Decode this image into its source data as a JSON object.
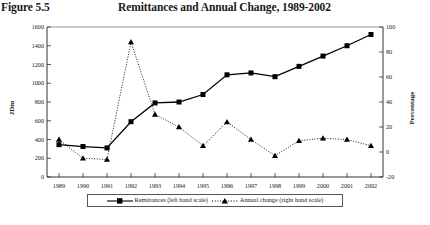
{
  "header": {
    "figure_label": "Figure 5.5",
    "title": "Remittances and Annual Change, 1989-2002"
  },
  "legend": {
    "items": [
      {
        "label": "Remittances (left hand scale)",
        "marker": "square",
        "line": "solid",
        "color": "#000000"
      },
      {
        "label": "Annual change (right hand scale)",
        "marker": "triangle",
        "line": "dotted",
        "color": "#000000"
      }
    ]
  },
  "chart_data": {
    "type": "line",
    "title": "Remittances and Annual Change, 1989-2002",
    "xlabel": "Year",
    "ylabel": "JDm",
    "y2label": "Percentage",
    "categories": [
      "1989",
      "1990",
      "1991",
      "1992",
      "1993",
      "1994",
      "1995",
      "1996",
      "1997",
      "1998",
      "1999",
      "2000",
      "2001",
      "2002"
    ],
    "ylim": [
      0,
      1600
    ],
    "yticks": [
      "0",
      "200",
      "400",
      "600",
      "800",
      "1000",
      "1200",
      "1400",
      "1600"
    ],
    "y2lim": [
      -20,
      100
    ],
    "y2ticks": [
      "-20",
      "0",
      "20",
      "40",
      "60",
      "80",
      "100"
    ],
    "grid": false,
    "legend_position": "bottom",
    "series": [
      {
        "name": "Remittances (left hand scale)",
        "axis": "left",
        "units": "JDm",
        "marker": "square",
        "line": "solid",
        "values": [
          345,
          325,
          310,
          590,
          790,
          800,
          880,
          1090,
          1110,
          1070,
          1180,
          1290,
          1400,
          1520
        ]
      },
      {
        "name": "Annual change (right hand scale)",
        "axis": "right",
        "units": "Percentage",
        "marker": "triangle",
        "line": "dotted",
        "values": [
          10,
          -5,
          -6,
          88,
          30,
          20,
          5,
          24,
          10,
          -3,
          9,
          11,
          10,
          5
        ]
      }
    ]
  }
}
